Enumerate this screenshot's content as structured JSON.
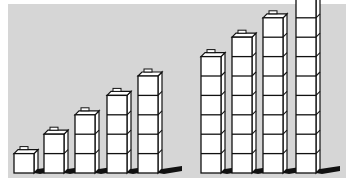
{
  "figure": {
    "colors": {
      "background": "#d6d6d6",
      "cube_face": "#ffffff",
      "outline": "#111111",
      "shadow": "#111111"
    },
    "groups": [
      {
        "name": "left-group",
        "towers": [
          {
            "cubes": 1,
            "x": 14
          },
          {
            "cubes": 2,
            "x": 44
          },
          {
            "cubes": 3,
            "x": 75
          },
          {
            "cubes": 4,
            "x": 107
          },
          {
            "cubes": 5,
            "x": 138
          }
        ]
      },
      {
        "name": "right-group",
        "towers": [
          {
            "cubes": 6,
            "x": 201
          },
          {
            "cubes": 7,
            "x": 232
          },
          {
            "cubes": 8,
            "x": 263
          },
          {
            "cubes": 9,
            "x": 296
          }
        ]
      }
    ],
    "base_y": 173,
    "cube_size": 20,
    "depth": 4
  }
}
